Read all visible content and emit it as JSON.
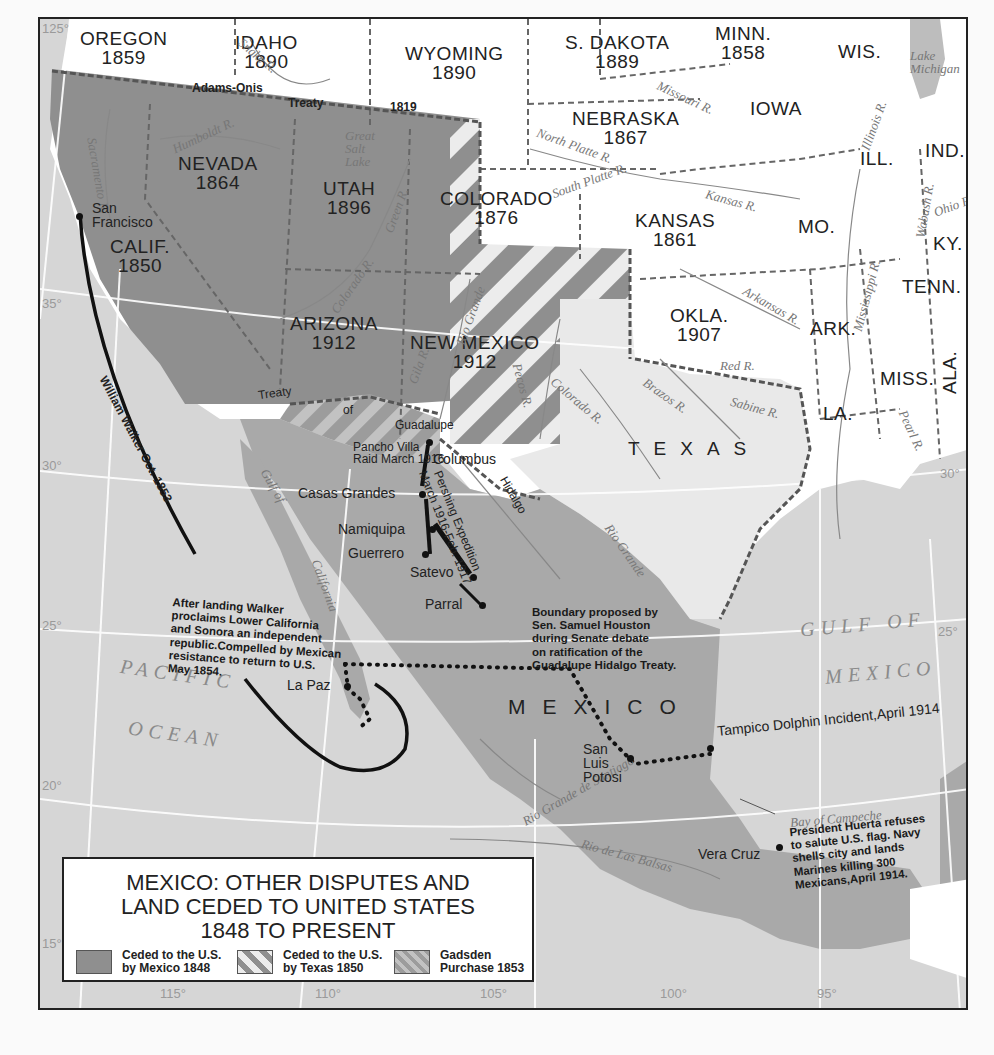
{
  "map": {
    "title_lines": [
      "MEXICO: OTHER DISPUTES AND",
      "LAND CEDED TO UNITED STATES",
      "1848 TO PRESENT"
    ],
    "colors": {
      "ceded_1848": "#8f8f8f",
      "us_land": "#ffffff",
      "mexico_land": "#a9a9a9",
      "texas": "#e9e9e9",
      "water": "#d6d6d6",
      "stripe_light": "#ececec",
      "route_line": "#111111"
    },
    "states": [
      {
        "name": "OREGON",
        "year": "1859"
      },
      {
        "name": "IDAHO",
        "year": "1890"
      },
      {
        "name": "WYOMING",
        "year": "1890"
      },
      {
        "name": "S. DAKOTA",
        "year": "1889"
      },
      {
        "name": "MINN.",
        "year": "1858"
      },
      {
        "name": "WIS.",
        "year": ""
      },
      {
        "name": "NEBRASKA",
        "year": "1867"
      },
      {
        "name": "IOWA",
        "year": ""
      },
      {
        "name": "ILL.",
        "year": ""
      },
      {
        "name": "IND.",
        "year": ""
      },
      {
        "name": "NEVADA",
        "year": "1864"
      },
      {
        "name": "UTAH",
        "year": "1896"
      },
      {
        "name": "COLORADO",
        "year": "1876"
      },
      {
        "name": "KANSAS",
        "year": "1861"
      },
      {
        "name": "MO.",
        "year": ""
      },
      {
        "name": "KY.",
        "year": ""
      },
      {
        "name": "CALIF.",
        "year": "1850"
      },
      {
        "name": "TENN.",
        "year": ""
      },
      {
        "name": "ARIZONA",
        "year": "1912"
      },
      {
        "name": "NEW MEXICO",
        "year": "1912"
      },
      {
        "name": "OKLA.",
        "year": "1907"
      },
      {
        "name": "ARK.",
        "year": ""
      },
      {
        "name": "MISS.",
        "year": ""
      },
      {
        "name": "ALA.",
        "year": ""
      },
      {
        "name": "LA.",
        "year": ""
      },
      {
        "name": "TEXAS",
        "year": ""
      },
      {
        "name": "MEXICO",
        "year": ""
      }
    ],
    "rivers": [
      "Snake R.",
      "Humboldt R.",
      "Sacramento R.",
      "Green R.",
      "Colorado R.",
      "Missouri R.",
      "North Platte R.",
      "South Platte R.",
      "Kansas R.",
      "Illinois R.",
      "Wabash R.",
      "Ohio R.",
      "Arkansas R.",
      "Mississippi R.",
      "Red R.",
      "Rio Grande",
      "Gila R.",
      "Pecos R.",
      "Colorado R.",
      "Brazos R.",
      "Sabine R.",
      "Pearl R.",
      "Rio Grande de Santiago",
      "Rio de Las Balsas"
    ],
    "water_labels": {
      "lake": [
        "Lake",
        "Michigan"
      ],
      "salt_lake": [
        "Great",
        "Salt",
        "Lake"
      ],
      "gulf_ca": [
        "Gulf",
        "of",
        "California"
      ],
      "pacific": [
        "PACIFIC",
        "OCEAN"
      ],
      "gulf_mx": [
        "GULF OF",
        "MEXICO"
      ],
      "campeche": "Bay of Campeche"
    },
    "places": {
      "san_francisco": [
        "San",
        "Francisco"
      ],
      "columbus": "Columbus",
      "casas_grandes": "Casas Grandes",
      "namiquipa": "Namiquipa",
      "guerrero": "Guerrero",
      "satevo": "Satevo",
      "parral": "Parral",
      "la_paz": "La Paz",
      "san_luis_potosi": [
        "San",
        "Luis",
        "Potosi"
      ],
      "vera_cruz": "Vera Cruz",
      "tampico": "Tampico Dolphin Incident,April 1914"
    },
    "treaty_labels": {
      "adams_onis": [
        "Adams-Onis",
        "Treaty",
        "1819"
      ],
      "guadalupe_hidalgo": [
        "Treaty",
        "of",
        "Guadalupe",
        "Hidalgo"
      ]
    },
    "annotations": {
      "walker_route": "William Walker Oct. 1853",
      "walker_note": [
        "After landing Walker",
        "proclaims Lower California",
        "and Sonora an independent",
        "republic.Compelled by Mexican",
        "resistance to return to U.S.",
        "May 1854."
      ],
      "villa_raid": [
        "Pancho Villa",
        "Raid March 1916"
      ],
      "pershing": [
        "Pershing Expedition",
        "March 1916-Feb. 1917"
      ],
      "houston": [
        "Boundary proposed by",
        "Sen. Samuel Houston",
        "during Senate debate",
        "on ratification of the",
        "Guadalupe Hidalgo Treaty."
      ],
      "huerta": [
        "President Huerta refuses",
        "to salute U.S. flag. Navy",
        "shells city and lands",
        "Marines killing 300",
        "Mexicans,April 1914."
      ]
    },
    "latitude_labels": [
      "125°",
      "35°",
      "30°",
      "25°",
      "20°",
      "15°",
      "30°",
      "25°"
    ],
    "longitude_labels": [
      "115°",
      "110°",
      "105°",
      "100°",
      "95°"
    ]
  },
  "legend": {
    "items": [
      {
        "line1": "Ceded to the U.S.",
        "line2": "by Mexico 1848",
        "pattern": "solid"
      },
      {
        "line1": "Ceded to the U.S.",
        "line2": "by Texas 1850",
        "pattern": "stripes"
      },
      {
        "line1": "Gadsden",
        "line2": "Purchase 1853",
        "pattern": "dense-stripes"
      }
    ]
  }
}
